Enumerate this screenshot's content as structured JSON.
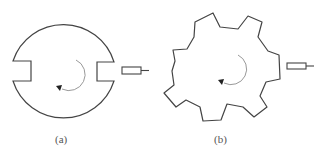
{
  "figure": {
    "panels": [
      {
        "id": "a",
        "label": "(a)",
        "shape": "notched-disc",
        "notches": 2,
        "rotation": "counterclockwise",
        "sensor": "proximity-sensor"
      },
      {
        "id": "b",
        "label": "(b)",
        "shape": "toothed-gear",
        "teeth": 7,
        "rotation": "counterclockwise",
        "sensor": "proximity-sensor"
      }
    ],
    "colors": {
      "stroke": "#444444",
      "arrow": "#888888",
      "label": "#555555"
    }
  }
}
